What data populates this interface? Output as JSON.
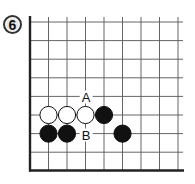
{
  "diagram": {
    "number": "6",
    "type": "go-board-corner",
    "grid": {
      "columns": 9,
      "rows": 9,
      "edges": [
        "left",
        "bottom"
      ]
    },
    "stones": [
      {
        "color": "white",
        "col": 1,
        "row": 5
      },
      {
        "color": "white",
        "col": 2,
        "row": 5
      },
      {
        "color": "white",
        "col": 3,
        "row": 5
      },
      {
        "color": "black",
        "col": 4,
        "row": 5
      },
      {
        "color": "black",
        "col": 1,
        "row": 6
      },
      {
        "color": "black",
        "col": 2,
        "row": 6
      },
      {
        "color": "black",
        "col": 5,
        "row": 6
      }
    ],
    "labels": [
      {
        "text": "A",
        "col": 3,
        "row": 4
      },
      {
        "text": "B",
        "col": 3,
        "row": 6
      }
    ],
    "colors": {
      "line": "#555555",
      "border": "#222222",
      "black_stone": "#111111",
      "white_stone": "#ffffff"
    }
  }
}
